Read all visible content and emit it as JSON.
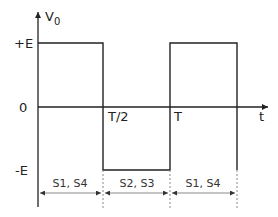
{
  "diagram": {
    "y_axis_label": "V",
    "y_axis_subscript": "0",
    "x_axis_label": "t",
    "levels": {
      "pos": "+E",
      "zero": "0",
      "neg": "-E"
    },
    "time_marks": {
      "half": "T/2",
      "full": "T"
    },
    "intervals": [
      {
        "label": "S1, S4"
      },
      {
        "label": "S2, S3"
      },
      {
        "label": "S1, S4"
      }
    ],
    "colors": {
      "line": "#222222",
      "dash": "#888888",
      "text": "#222222"
    }
  }
}
